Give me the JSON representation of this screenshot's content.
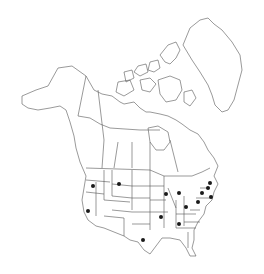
{
  "map": {
    "title": "North America distribution map",
    "region": "North America",
    "line_color": "#555555",
    "dot_color": "#1a1a1a",
    "occurrences": [
      {
        "name": "Oregon",
        "x": 93,
        "y": 186
      },
      {
        "name": "Montana",
        "x": 119,
        "y": 184
      },
      {
        "name": "California",
        "x": 88,
        "y": 211
      },
      {
        "name": "Wisconsin",
        "x": 166,
        "y": 194
      },
      {
        "name": "Michigan",
        "x": 179,
        "y": 193
      },
      {
        "name": "Ohio",
        "x": 186,
        "y": 207
      },
      {
        "name": "Pennsylvania",
        "x": 198,
        "y": 202
      },
      {
        "name": "New York",
        "x": 202,
        "y": 193
      },
      {
        "name": "Vermont",
        "x": 208,
        "y": 188
      },
      {
        "name": "Maine",
        "x": 210,
        "y": 183
      },
      {
        "name": "Massachusetts",
        "x": 211,
        "y": 197
      },
      {
        "name": "Missouri",
        "x": 161,
        "y": 217
      },
      {
        "name": "Tennessee",
        "x": 179,
        "y": 224
      },
      {
        "name": "Texas",
        "x": 143,
        "y": 240
      }
    ]
  }
}
